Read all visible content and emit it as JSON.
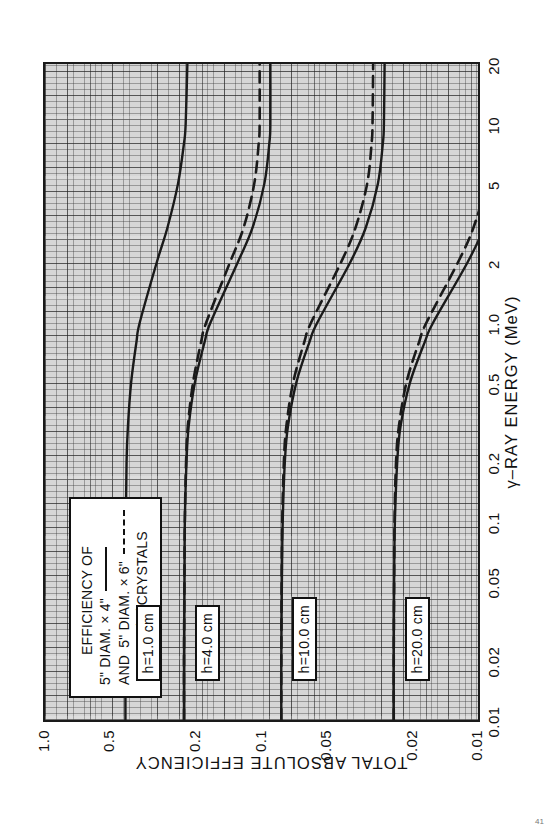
{
  "figure": {
    "rotated": true,
    "background": "#ffffff",
    "plot_background": "#d6d6d6",
    "ink_color": "#1a1a1a"
  },
  "legend": {
    "title": "EFFICIENCY  OF",
    "entry1_label": "5\" DIAM. × 4\"",
    "entry1_style": "solid",
    "entry2_prefix": "AND",
    "entry2_label": "5\" DIAM. × 6\"",
    "entry2_style": "dashed",
    "material": "NaI (Tℓ)CRYSTALS"
  },
  "axes": {
    "x_title": "γ–RAY ENERGY (MeV)",
    "y_title": "TOTAL ABSOLUTE EFFICIENCY",
    "x_ticks": [
      "0.01",
      "0.02",
      "0.05",
      "0.1",
      "0.2",
      "0.5",
      "1.0",
      "2",
      "5",
      "10",
      "20"
    ],
    "y_ticks": [
      "1.0",
      "0.5",
      "0.2",
      "0.1",
      "0.05",
      "0.02",
      "0.01"
    ],
    "x_scale": "log",
    "y_scale": "log"
  },
  "curve_labels": [
    {
      "text": "h=1.0 cm"
    },
    {
      "text": "h=4.0 cm"
    },
    {
      "text": "h=10.0 cm"
    },
    {
      "text": "h=20.0 cm"
    }
  ],
  "chart_data": {
    "type": "line",
    "title": "",
    "xlabel": "γ-RAY ENERGY (MeV)",
    "ylabel": "TOTAL ABSOLUTE EFFICIENCY",
    "xscale": "log",
    "yscale": "log",
    "xlim": [
      0.01,
      20
    ],
    "ylim": [
      0.01,
      1.0
    ],
    "grid": true,
    "legend_position": "upper-left",
    "x": [
      0.01,
      0.02,
      0.05,
      0.1,
      0.2,
      0.3,
      0.5,
      0.8,
      1.0,
      2,
      3,
      5,
      8,
      10,
      20
    ],
    "series": [
      {
        "name": "h=1.0 cm, 5\" DIAM. x 4\"",
        "style": "solid",
        "source_distance_cm": 1.0,
        "crystal": "5\" DIAM. x 4\"",
        "values": [
          0.425,
          0.425,
          0.424,
          0.423,
          0.42,
          0.414,
          0.4,
          0.378,
          0.365,
          0.305,
          0.272,
          0.243,
          0.228,
          0.224,
          0.22
        ]
      },
      {
        "name": "h=4.0 cm, 5\" DIAM. x 4\"",
        "style": "solid",
        "source_distance_cm": 4.0,
        "crystal": "5\" DIAM. x 4\"",
        "values": [
          0.228,
          0.228,
          0.227,
          0.226,
          0.222,
          0.217,
          0.203,
          0.183,
          0.172,
          0.129,
          0.11,
          0.097,
          0.092,
          0.091,
          0.091
        ]
      },
      {
        "name": "h=4.0 cm, 5\" DIAM. x 6\"",
        "style": "dashed",
        "source_distance_cm": 4.0,
        "crystal": "5\" DIAM. x 6\"",
        "values": [
          0.228,
          0.228,
          0.227,
          0.226,
          0.223,
          0.219,
          0.207,
          0.19,
          0.18,
          0.14,
          0.121,
          0.108,
          0.103,
          0.102,
          0.102
        ]
      },
      {
        "name": "h=10.0 cm, 5\" DIAM. x 4\"",
        "style": "solid",
        "source_distance_cm": 10.0,
        "crystal": "5\" DIAM. x 4\"",
        "values": [
          0.081,
          0.081,
          0.0805,
          0.0798,
          0.078,
          0.0755,
          0.069,
          0.06,
          0.0552,
          0.039,
          0.033,
          0.029,
          0.0275,
          0.0272,
          0.027
        ]
      },
      {
        "name": "h=10.0 cm, 5\" DIAM. x 6\"",
        "style": "dashed",
        "source_distance_cm": 10.0,
        "crystal": "5\" DIAM. x 6\"",
        "values": [
          0.081,
          0.081,
          0.0807,
          0.0802,
          0.0788,
          0.0768,
          0.0714,
          0.0634,
          0.059,
          0.043,
          0.0368,
          0.0325,
          0.031,
          0.0307,
          0.0305
        ]
      },
      {
        "name": "h=20.0 cm, 5\" DIAM. x 4\"",
        "style": "solid",
        "source_distance_cm": 20.0,
        "crystal": "5\" DIAM. x 4\"",
        "values": [
          0.0245,
          0.0245,
          0.0244,
          0.0242,
          0.0236,
          0.0228,
          0.0206,
          0.0176,
          0.0161,
          0.0112,
          0.0094,
          0.0082,
          0.0078,
          0.0077,
          0.0076
        ]
      },
      {
        "name": "h=20.0 cm, 5\" DIAM. x 6\"",
        "style": "dashed",
        "source_distance_cm": 20.0,
        "crystal": "5\" DIAM. x 6\"",
        "values": [
          0.0245,
          0.0245,
          0.0244,
          0.0243,
          0.0239,
          0.0232,
          0.0214,
          0.0187,
          0.0173,
          0.0124,
          0.0105,
          0.0092,
          0.0088,
          0.0087,
          0.0086
        ]
      }
    ]
  },
  "folio": {
    "text": "41"
  }
}
